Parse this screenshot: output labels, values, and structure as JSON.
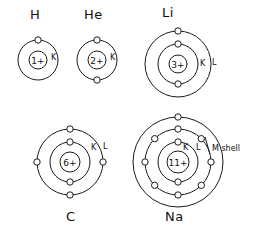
{
  "diagram": {
    "ink_color": "#1a1a1a",
    "background": "#ffffff"
  },
  "atoms": [
    {
      "id": "hydrogen",
      "symbol": "H",
      "nucleus_charge": "1+",
      "shell_labels": [
        "K"
      ],
      "shells": [
        {
          "name": "K",
          "electron_count": 1,
          "electron_angles": [
            -90
          ]
        }
      ]
    },
    {
      "id": "helium",
      "symbol": "He",
      "nucleus_charge": "2+",
      "shell_labels": [
        "K"
      ],
      "shells": [
        {
          "name": "K",
          "electron_count": 2,
          "electron_angles": [
            -90,
            90
          ]
        }
      ]
    },
    {
      "id": "lithium",
      "symbol": "Li",
      "nucleus_charge": "3+",
      "shell_labels": [
        "K",
        "L"
      ],
      "shells": [
        {
          "name": "K",
          "electron_count": 2,
          "electron_angles": [
            -90,
            90
          ]
        },
        {
          "name": "L",
          "electron_count": 1,
          "electron_angles": [
            -90
          ]
        }
      ]
    },
    {
      "id": "carbon",
      "symbol": "C",
      "nucleus_charge": "6+",
      "shell_labels": [
        "K",
        "L"
      ],
      "shells": [
        {
          "name": "K",
          "electron_count": 2,
          "electron_angles": [
            -90,
            90
          ]
        },
        {
          "name": "L",
          "electron_count": 4,
          "electron_angles": [
            -90,
            0,
            90,
            180
          ]
        }
      ]
    },
    {
      "id": "sodium",
      "symbol": "Na",
      "nucleus_charge": "11+",
      "shell_labels": [
        "K",
        "L",
        "M shell"
      ],
      "shells": [
        {
          "name": "K",
          "electron_count": 2,
          "electron_angles": [
            -90,
            90
          ]
        },
        {
          "name": "L",
          "electron_count": 8,
          "electron_angles": [
            -90,
            -45,
            0,
            45,
            90,
            135,
            180,
            225
          ]
        },
        {
          "name": "M",
          "electron_count": 1,
          "electron_angles": [
            0
          ]
        }
      ]
    }
  ],
  "labels": {
    "hydrogen_symbol": "H",
    "helium_symbol": "He",
    "lithium_symbol": "Li",
    "carbon_symbol": "C",
    "sodium_symbol": "Na",
    "hydrogen_nucleus": "1+",
    "helium_nucleus": "2+",
    "lithium_nucleus": "3+",
    "carbon_nucleus": "6+",
    "sodium_nucleus": "11+",
    "h_k": "K",
    "he_k": "K",
    "li_k": "K",
    "li_l": "L",
    "c_k": "K",
    "c_l": "L",
    "na_k": "K",
    "na_l": "L",
    "na_m": "M shell"
  }
}
